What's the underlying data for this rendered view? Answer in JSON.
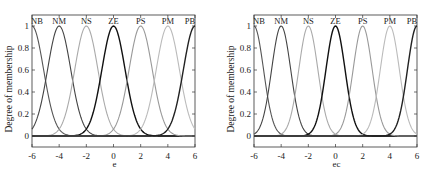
{
  "chart_data": [
    {
      "type": "line",
      "title": "",
      "xlabel": "e",
      "ylabel": "Degree of membership",
      "xlim": [
        -6,
        6
      ],
      "ylim": [
        -0.1,
        1.1
      ],
      "xticks": [
        "-6",
        "-4",
        "-2",
        "0",
        "2",
        "4",
        "6"
      ],
      "yticks": [
        "0",
        "0.2",
        "0.4",
        "0.6",
        "0.8",
        "1"
      ],
      "grid": false,
      "legend": "none (labels above peaks)",
      "membership_function": "gaussian",
      "sigma": 0.85,
      "series": [
        {
          "name": "NB",
          "center": -6,
          "color": "#555555"
        },
        {
          "name": "NM",
          "center": -4,
          "color": "#444444"
        },
        {
          "name": "NS",
          "center": -2,
          "color": "#aaaaaa"
        },
        {
          "name": "ZE",
          "center": 0,
          "color": "#111111"
        },
        {
          "name": "PS",
          "center": 2,
          "color": "#999999"
        },
        {
          "name": "PM",
          "center": 4,
          "color": "#bbbbbb"
        },
        {
          "name": "PB",
          "center": 6,
          "color": "#222222"
        }
      ]
    },
    {
      "type": "line",
      "title": "",
      "xlabel": "ec",
      "ylabel": "Degree of membership",
      "xlim": [
        -6,
        6
      ],
      "ylim": [
        -0.1,
        1.1
      ],
      "xticks": [
        "-6",
        "-4",
        "-2",
        "0",
        "2",
        "4",
        "6"
      ],
      "yticks": [
        "0",
        "0.2",
        "0.4",
        "0.6",
        "0.8",
        "1"
      ],
      "grid": false,
      "legend": "none (labels above peaks)",
      "membership_function": "gaussian",
      "sigma": 0.7,
      "series": [
        {
          "name": "NB",
          "center": -6,
          "color": "#555555"
        },
        {
          "name": "NM",
          "center": -4,
          "color": "#444444"
        },
        {
          "name": "NS",
          "center": -2,
          "color": "#aaaaaa"
        },
        {
          "name": "ZE",
          "center": 0,
          "color": "#111111"
        },
        {
          "name": "PS",
          "center": 2,
          "color": "#999999"
        },
        {
          "name": "PM",
          "center": 4,
          "color": "#bbbbbb"
        },
        {
          "name": "PB",
          "center": 6,
          "color": "#222222"
        }
      ]
    }
  ],
  "panels": [
    {
      "xlabel": "e",
      "ylabel": "Degree of membership"
    },
    {
      "xlabel": "ec",
      "ylabel": "Degree of membership"
    }
  ]
}
